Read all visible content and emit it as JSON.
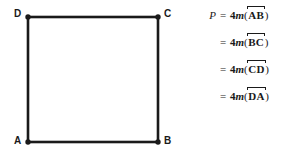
{
  "figure": {
    "shape_name": "square",
    "vertices": [
      {
        "label": "D",
        "x": 28,
        "y": 17,
        "position": "top-left"
      },
      {
        "label": "C",
        "x": 158,
        "y": 17,
        "position": "top-right"
      },
      {
        "label": "B",
        "x": 158,
        "y": 142,
        "position": "bottom-right"
      },
      {
        "label": "A",
        "x": 28,
        "y": 142,
        "position": "bottom-left"
      }
    ],
    "stroke_color": "#1a1a1a",
    "fill_color": "#ffffff",
    "stroke_width": 2.5,
    "vertex_dot_radius": 2.6
  },
  "equations": {
    "rows": [
      {
        "lhs": "P",
        "eq": "=",
        "coefficient": "4",
        "function": "m",
        "open": "(",
        "segment": "AB",
        "close": ")"
      },
      {
        "lhs": "",
        "eq": "=",
        "coefficient": "4",
        "function": "m",
        "open": "(",
        "segment": "BC",
        "close": ")"
      },
      {
        "lhs": "",
        "eq": "=",
        "coefficient": "4",
        "function": "m",
        "open": "(",
        "segment": "CD",
        "close": ")"
      },
      {
        "lhs": "",
        "eq": "=",
        "coefficient": "4",
        "function": "m",
        "open": "(",
        "segment": "DA",
        "close": ")"
      }
    ]
  },
  "colors": {
    "ink": "#1a1a1a",
    "background": "#ffffff"
  }
}
